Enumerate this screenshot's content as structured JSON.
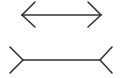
{
  "figure": {
    "name": "Müller-Lyer illusion",
    "background": "#ffffff",
    "stroke_color": "#333333",
    "stroke_width": 1.6,
    "top_figure": {
      "style": "arrowheads-inward",
      "shaft": {
        "x1": 22,
        "y1": 15,
        "x2": 101,
        "y2": 15
      },
      "left_fins": [
        [
          35,
          2
        ],
        [
          35,
          27
        ]
      ],
      "right_fins": [
        [
          88,
          2
        ],
        [
          88,
          27
        ]
      ]
    },
    "bottom_figure": {
      "style": "fins-outward",
      "shaft": {
        "x1": 23,
        "y1": 60,
        "x2": 100,
        "y2": 60
      },
      "left_fins": [
        [
          10,
          47
        ],
        [
          10,
          73
        ]
      ],
      "right_fins": [
        [
          112,
          47
        ],
        [
          112,
          73
        ]
      ]
    }
  }
}
